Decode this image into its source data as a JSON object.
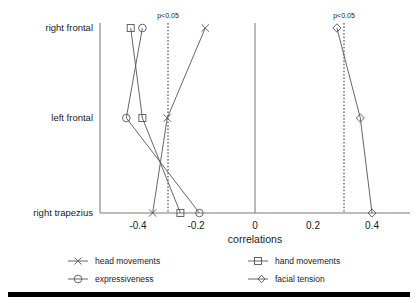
{
  "chart_data": {
    "type": "line",
    "title": "",
    "subtitle": "",
    "xlabel": "correlations",
    "ylabel": "",
    "orientation": "horizontal-categories",
    "categories": [
      "right frontal",
      "left frontal",
      "right trapezius"
    ],
    "xlim": [
      -0.48,
      0.46
    ],
    "xticks": [
      -0.4,
      -0.2,
      0,
      0.2,
      0.4
    ],
    "xticklabels": [
      "-0.4",
      "-0.2",
      "0",
      "0.2",
      "0.4"
    ],
    "grid": false,
    "legend_position": "bottom",
    "series": [
      {
        "name": "head movements",
        "marker": "x",
        "values": [
          -0.17,
          -0.3,
          -0.35
        ]
      },
      {
        "name": "hand movements",
        "marker": "square",
        "values": [
          -0.425,
          -0.385,
          -0.255
        ]
      },
      {
        "name": "expressiveness",
        "marker": "circle",
        "values": [
          -0.385,
          -0.44,
          -0.19
        ]
      },
      {
        "name": "facial tension",
        "marker": "diamond",
        "values": [
          0.28,
          0.36,
          0.4
        ]
      }
    ],
    "annotations": [
      {
        "label": "p<0.05",
        "x": -0.3,
        "kind": "significance-threshold-line"
      },
      {
        "label": "p<0.05",
        "x": 0.305,
        "kind": "significance-threshold-line"
      }
    ],
    "reference_lines": [
      {
        "x": 0,
        "kind": "zero-line"
      }
    ]
  },
  "axis": {
    "xtitle": "correlations",
    "ytick_labels": [
      "right frontal",
      "left frontal",
      "right trapezius"
    ],
    "xtick_labels": [
      "-0.4",
      "-0.2",
      "0",
      "0.2",
      "0.4"
    ]
  },
  "annotations": {
    "left_significance": "p<0.05",
    "right_significance": "p<0.05"
  },
  "legend": {
    "entries": [
      {
        "label": "head movements",
        "marker": "x-marker"
      },
      {
        "label": "hand movements",
        "marker": "square-marker"
      },
      {
        "label": "expressiveness",
        "marker": "circle-marker"
      },
      {
        "label": "facial tension",
        "marker": "diamond-marker"
      }
    ]
  },
  "colors": {
    "line": "#555555",
    "axis": "#777777",
    "text": "#1a1a1a",
    "rule": "#000000",
    "background": "#ffffff"
  }
}
